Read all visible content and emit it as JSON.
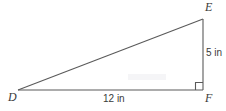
{
  "figure": {
    "type": "right-triangle-diagram",
    "vertices": [
      {
        "name": "D",
        "label": "D",
        "x": 18,
        "y": 90
      },
      {
        "name": "E",
        "label": "E",
        "x": 203,
        "y": 19
      },
      {
        "name": "F",
        "label": "F",
        "x": 203,
        "y": 90
      }
    ],
    "sides": [
      {
        "name": "base",
        "label": "12 in",
        "from": "D",
        "to": "F"
      },
      {
        "name": "height",
        "label": "5 in",
        "from": "E",
        "to": "F"
      },
      {
        "name": "hypotenuse",
        "label": "",
        "from": "D",
        "to": "E"
      }
    ],
    "right_angle_at": "F",
    "colors": {
      "stroke": "#5a5a5a",
      "text": "#3a3a3a",
      "background": "#ffffff",
      "watermark": "#f4f4f6"
    }
  }
}
